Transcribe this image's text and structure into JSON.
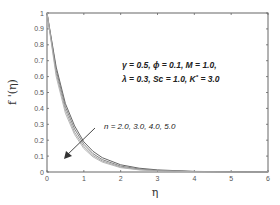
{
  "chart_data": {
    "type": "line",
    "title": "",
    "xlabel": "η",
    "ylabel": "f '(η)",
    "xlim": [
      0,
      6
    ],
    "ylim": [
      0,
      1
    ],
    "xticks": [
      "0",
      "1",
      "2",
      "3",
      "4",
      "5",
      "6"
    ],
    "yticks": [
      "0",
      "0.1",
      "0.2",
      "0.3",
      "0.4",
      "0.5",
      "0.6",
      "0.7",
      "0.8",
      "0.9",
      "1"
    ],
    "grid": false,
    "legend": null,
    "x": [
      0,
      0.25,
      0.5,
      0.75,
      1.0,
      1.25,
      1.5,
      2.0,
      2.5,
      3.0,
      4.0,
      5.0,
      6.0
    ],
    "series": [
      {
        "name": "n = 2.0",
        "values": [
          1.0,
          0.66,
          0.43,
          0.29,
          0.19,
          0.13,
          0.09,
          0.045,
          0.024,
          0.013,
          0.004,
          0.001,
          0.0
        ]
      },
      {
        "name": "n = 3.0",
        "values": [
          1.0,
          0.64,
          0.41,
          0.27,
          0.175,
          0.115,
          0.078,
          0.037,
          0.019,
          0.01,
          0.003,
          0.001,
          0.0
        ]
      },
      {
        "name": "n = 4.0",
        "values": [
          1.0,
          0.62,
          0.39,
          0.25,
          0.16,
          0.104,
          0.069,
          0.031,
          0.015,
          0.008,
          0.002,
          0.0,
          0.0
        ]
      },
      {
        "name": "n = 5.0",
        "values": [
          1.0,
          0.6,
          0.37,
          0.235,
          0.148,
          0.095,
          0.062,
          0.027,
          0.013,
          0.006,
          0.002,
          0.0,
          0.0
        ]
      }
    ],
    "annotations": [
      {
        "text": "γ = 0.5,  ϕ = 0.1,  M = 1.0,",
        "x": 2.05,
        "y": 0.68
      },
      {
        "text": "λ = 0.3,  Sc = 1.0,  K* = 3.0",
        "x": 2.05,
        "y": 0.58
      },
      {
        "text": "n = 2.0, 3.0, 4.0, 5.0",
        "x": 1.55,
        "y": 0.23
      },
      {
        "text": "arrow: direction of increasing n",
        "from": [
          1.3,
          0.23
        ],
        "to": [
          0.55,
          0.08
        ]
      }
    ]
  },
  "annotation_lines": {
    "line1": "γ = 0.5,  ϕ = 0.1,  M = 1.0,",
    "line2": "λ = 0.3,  Sc = 1.0,  K",
    "line2_sup": "*",
    "line2_tail": " = 3.0",
    "n_label": "n = 2.0, 3.0, 4.0, 5.0"
  },
  "colors": {
    "axes": "#666666",
    "curves": [
      "#555555",
      "#777777",
      "#999999",
      "#b0b0b0"
    ],
    "arrow": "#333333"
  }
}
